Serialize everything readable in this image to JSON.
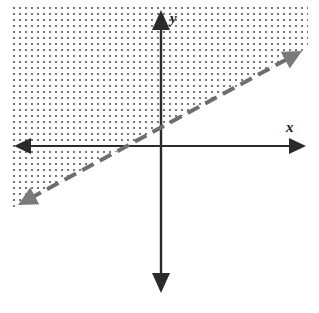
{
  "figure": {
    "width": 319,
    "height": 313,
    "background_color": "#ffffff"
  },
  "labels": {
    "x_axis": "x",
    "y_axis": "y"
  },
  "colors": {
    "axis": "#2b2b2b",
    "boundary_line": "#6e6e6e",
    "boundary_arrowhead": "#7a7a7a",
    "shading_dot": "#555555",
    "background": "#ffffff"
  },
  "chart_data": {
    "type": "line",
    "title": "",
    "subtitle": "",
    "xlabel": "x",
    "ylabel": "y",
    "grid": false,
    "legend": "none",
    "origin_px": {
      "x": 161,
      "y": 146
    },
    "axes": {
      "x_axis": {
        "label": "x",
        "arrow_left_tip_px": {
          "x": 14,
          "y": 146
        },
        "arrow_right_tip_px": {
          "x": 306,
          "y": 146
        },
        "double_headed": true,
        "tick_labels": [],
        "color": "#2b2b2b"
      },
      "y_axis": {
        "label": "y",
        "arrow_top_tip_px": {
          "x": 161,
          "y": 10
        },
        "arrow_bottom_tip_px": {
          "x": 161,
          "y": 293
        },
        "double_headed": true,
        "tick_labels": [],
        "color": "#2b2b2b"
      }
    },
    "series": [
      {
        "name": "boundary line",
        "style": "dashed",
        "stroke": "#6e6e6e",
        "stroke_width_px": 4,
        "dash_pattern_px": [
          13,
          7
        ],
        "double_headed_arrows": true,
        "endpoints_px": [
          {
            "x": 18,
            "y": 205
          },
          {
            "x": 302,
            "y": 51
          }
        ],
        "x_intercept_px": {
          "x": 123,
          "y": 146
        },
        "y_intercept_px": {
          "x": 161,
          "y": 128
        },
        "slope_px_per_px": -0.542,
        "description": "dashed boundary line rising from lower-left to upper-right, positive slope, positive y-intercept"
      }
    ],
    "shaded_region": {
      "fill": "dotted-pattern",
      "dot_color": "#555555",
      "dot_spacing_px": 6,
      "dot_radius_px": 1.1,
      "side": "above",
      "description": "half-plane above the dashed boundary line is shaded with a dot pattern"
    },
    "annotations": []
  }
}
